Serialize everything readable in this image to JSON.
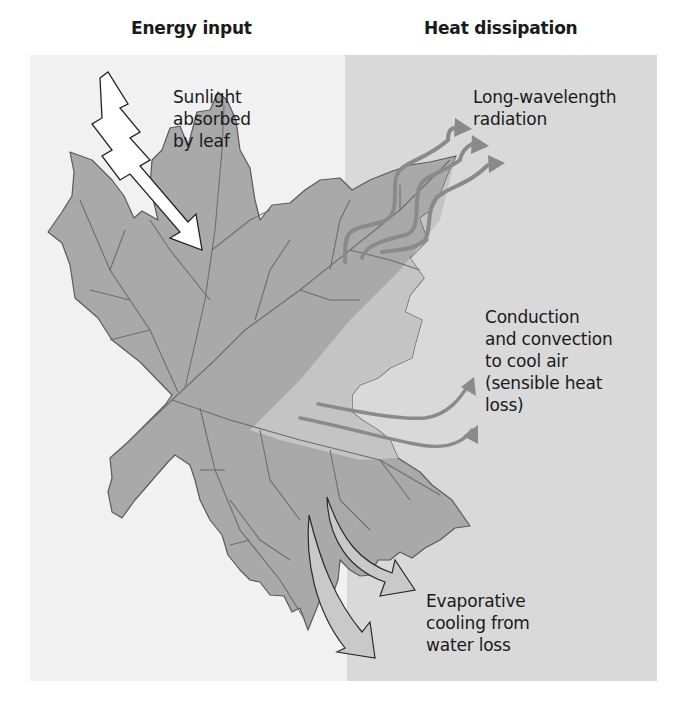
{
  "headers": {
    "left": "Energy input",
    "right": "Heat dissipation"
  },
  "panels": {
    "left_color": "#f1f1f1",
    "right_color": "#d9d9d9"
  },
  "labels": {
    "sunlight": "Sunlight\nabsorbed\nby leaf",
    "long_wavelength": "Long-wavelength\nradiation",
    "conduction": "Conduction\nand convection\nto cool air\n(sensible heat\nloss)",
    "evaporative": "Evaporative\ncooling from\nwater loss"
  },
  "icons": {
    "sunlight_arrow": "lightning-arrow-icon",
    "radiation_arrows": "wavy-arrow-icon",
    "convection_arrows": "curved-arrow-icon",
    "evaporation_arrows": "curved-block-arrow-icon",
    "leaf": "maple-leaf-illustration"
  },
  "colors": {
    "leaf_fill": "#a9a9a9",
    "leaf_fill_light": "#c4c4c4",
    "vein": "#6e6e6e",
    "arrow_gray": "#8a8a8a",
    "text": "#1a1a1a"
  }
}
